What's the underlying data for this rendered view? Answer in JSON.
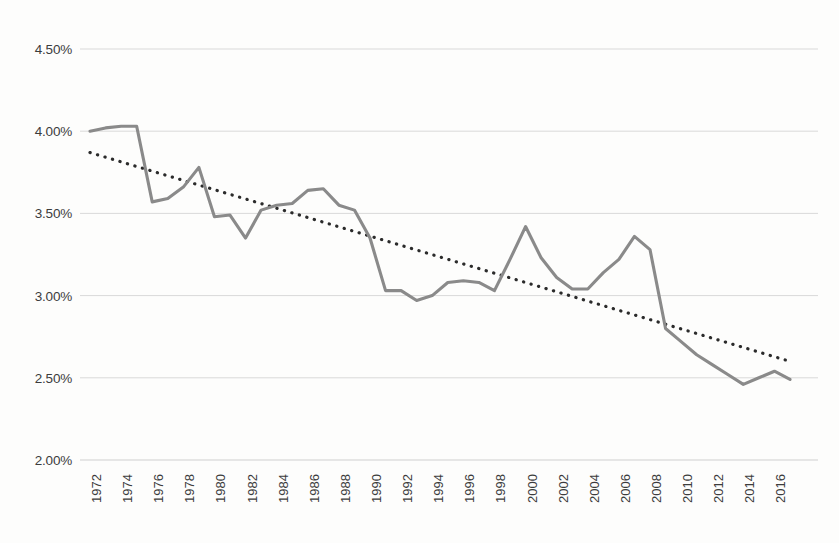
{
  "chart_data": {
    "type": "line",
    "title": "",
    "subtitle": "",
    "xlabel": "",
    "ylabel": "",
    "ylim": [
      2.0,
      4.5
    ],
    "ytick_values": [
      4.5,
      4.0,
      3.5,
      3.0,
      2.5,
      2.0
    ],
    "ytick_labels": [
      "4.50%",
      "4.00%",
      "3.50%",
      "3.00%",
      "2.50%",
      "2.00%"
    ],
    "xlim": [
      1972,
      2017
    ],
    "xtick_labels": [
      "1972",
      "1974",
      "1976",
      "1978",
      "1980",
      "1982",
      "1984",
      "1986",
      "1988",
      "1990",
      "1992",
      "1994",
      "1996",
      "1998",
      "2000",
      "2002",
      "2004",
      "2006",
      "2008",
      "2010",
      "2012",
      "2014",
      "2016"
    ],
    "xtick_values": [
      1972,
      1974,
      1976,
      1978,
      1980,
      1982,
      1984,
      1986,
      1988,
      1990,
      1992,
      1994,
      1996,
      1998,
      2000,
      2002,
      2004,
      2006,
      2008,
      2010,
      2012,
      2014,
      2016
    ],
    "x": [
      1972,
      1973,
      1974,
      1975,
      1976,
      1977,
      1978,
      1979,
      1980,
      1981,
      1982,
      1983,
      1984,
      1985,
      1986,
      1987,
      1988,
      1989,
      1990,
      1991,
      1992,
      1993,
      1994,
      1995,
      1996,
      1997,
      1998,
      1999,
      2000,
      2001,
      2002,
      2003,
      2004,
      2005,
      2006,
      2007,
      2008,
      2009,
      2010,
      2011,
      2012,
      2013,
      2014,
      2015,
      2016,
      2017
    ],
    "grid": true,
    "grid_axis": "y",
    "legend": false,
    "legend_position": "none",
    "series": [
      {
        "name": "Annual rate",
        "style": "solid",
        "color": "#8a8a8a",
        "values": [
          4.0,
          4.02,
          4.03,
          4.03,
          3.57,
          3.59,
          3.66,
          3.78,
          3.48,
          3.49,
          3.35,
          3.52,
          3.55,
          3.56,
          3.64,
          3.65,
          3.55,
          3.52,
          3.35,
          3.03,
          3.03,
          2.97,
          3.0,
          3.08,
          3.09,
          3.08,
          3.03,
          3.22,
          3.42,
          3.23,
          3.11,
          3.04,
          3.04,
          3.14,
          3.22,
          3.36,
          3.28,
          2.8,
          2.72,
          2.64,
          2.58,
          2.52,
          2.46,
          2.5,
          2.54,
          2.49
        ]
      },
      {
        "name": "Linear trend",
        "style": "dotted",
        "color": "#2b2b2b",
        "values": [
          3.87,
          3.84,
          3.81,
          3.79,
          3.76,
          3.73,
          3.7,
          3.68,
          3.65,
          3.62,
          3.59,
          3.57,
          3.54,
          3.51,
          3.48,
          3.46,
          3.43,
          3.4,
          3.37,
          3.35,
          3.32,
          3.29,
          3.26,
          3.24,
          3.21,
          3.18,
          3.15,
          3.13,
          3.1,
          3.07,
          3.04,
          3.02,
          2.99,
          2.96,
          2.93,
          2.91,
          2.88,
          2.85,
          2.82,
          2.8,
          2.77,
          2.74,
          2.71,
          2.69,
          2.66,
          2.6
        ]
      }
    ]
  }
}
